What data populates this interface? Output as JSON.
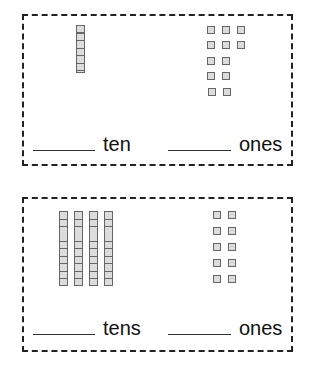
{
  "cards": [
    {
      "tens_rods": 1,
      "ones_cubes": 13,
      "tens_label": "ten",
      "ones_label": "ones",
      "tens_answer": "",
      "ones_answer": ""
    },
    {
      "tens_rods": 4,
      "ones_cubes": 10,
      "tens_label": "tens",
      "ones_label": "ones",
      "tens_answer": "",
      "ones_answer": ""
    }
  ],
  "colors": {
    "cube_fill": "#dcdcdc",
    "cube_border": "#666666",
    "card_border": "#222222"
  }
}
